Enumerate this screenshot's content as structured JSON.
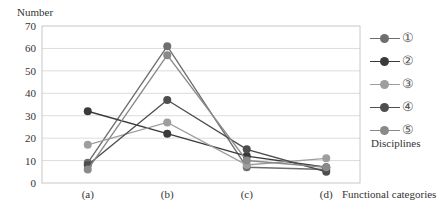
{
  "chart_data": {
    "type": "line",
    "title": "",
    "xlabel": "Functional categories",
    "ylabel": "Number",
    "categories": [
      "(a)",
      "(b)",
      "(c)",
      "(d)"
    ],
    "ylim": [
      0,
      70
    ],
    "yticks": [
      0,
      10,
      20,
      30,
      40,
      50,
      60,
      70
    ],
    "grid": true,
    "legend_title": "Disciplines",
    "legend_position": "right",
    "series": [
      {
        "name": "①",
        "color": "#6e6e6e",
        "values": [
          9,
          61,
          7,
          6
        ]
      },
      {
        "name": "②",
        "color": "#3a3a3a",
        "values": [
          32,
          22,
          12,
          7
        ]
      },
      {
        "name": "③",
        "color": "#9e9e9e",
        "values": [
          17,
          27,
          8,
          11
        ]
      },
      {
        "name": "④",
        "color": "#4e4e4e",
        "values": [
          8,
          37,
          15,
          5
        ]
      },
      {
        "name": "⑤",
        "color": "#8a8a8a",
        "values": [
          6,
          57,
          10,
          7
        ]
      }
    ]
  }
}
